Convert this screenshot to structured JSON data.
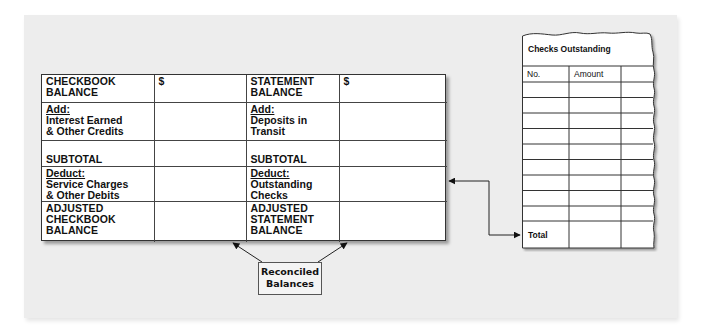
{
  "reconciliation_form": {
    "left": {
      "checkbook_balance": "CHECKBOOK BALANCE",
      "checkbook_balance_line1": "CHECKBOOK",
      "checkbook_balance_line2": "BALANCE",
      "dollar": "$",
      "add_label": "Add:",
      "add_line1": "Interest Earned",
      "add_line2": "& Other Credits",
      "subtotal": "SUBTOTAL",
      "deduct_label": "Deduct:",
      "deduct_line1": "Service Charges",
      "deduct_line2": "& Other Debits",
      "adjusted_line1": "ADJUSTED",
      "adjusted_line2": "CHECKBOOK",
      "adjusted_line3": "BALANCE"
    },
    "right": {
      "statement_balance_line1": "STATEMENT",
      "statement_balance_line2": "BALANCE",
      "dollar": "$",
      "add_label": "Add:",
      "add_line1": "Deposits in",
      "add_line2": "Transit",
      "subtotal": "SUBTOTAL",
      "deduct_label": "Deduct:",
      "deduct_line1": "Outstanding",
      "deduct_line2": "Checks",
      "adjusted_line1": "ADJUSTED",
      "adjusted_line2": "STATEMENT",
      "adjusted_line3": "BALANCE"
    }
  },
  "checks_outstanding": {
    "title": "Checks Outstanding",
    "columns": [
      "No.",
      "Amount",
      ""
    ],
    "blank_rows": 9,
    "total_label": "Total"
  },
  "callout": {
    "line1": "Reconciled",
    "line2": "Balances"
  },
  "colors": {
    "panel": "#ededed",
    "line": "#333333",
    "paper": "#ffffff"
  }
}
